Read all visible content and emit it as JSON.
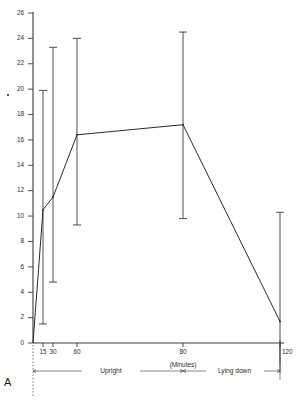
{
  "figure": {
    "panel_label": "A",
    "cut_off_header": "",
    "xlabel": "(Minutes)",
    "phases": [
      {
        "name": "Upright",
        "from_min": 0,
        "to_min": 80
      },
      {
        "name": "Lying down",
        "from_min": 80,
        "to_min": 120
      }
    ]
  },
  "chart_data": {
    "type": "line",
    "title": "",
    "subtitle": "",
    "xlabel": "(Minutes)",
    "ylabel": "",
    "x": [
      0,
      15,
      30,
      60,
      80,
      120
    ],
    "xtick_labels": [
      "15",
      "30",
      "60",
      "80",
      "120"
    ],
    "xticks": [
      15,
      30,
      60,
      80,
      120
    ],
    "xlim": [
      0,
      120
    ],
    "ylim": [
      0,
      26
    ],
    "yticks": [
      0,
      2,
      4,
      6,
      8,
      10,
      12,
      14,
      16,
      18,
      20,
      22,
      24,
      26
    ],
    "ytick_labels": [
      "0",
      "2",
      "4",
      "6",
      "8",
      "10",
      "12",
      "14",
      "16",
      "18",
      "20",
      "22",
      "24",
      "26"
    ],
    "grid": false,
    "legend": false,
    "axis_note": "x-axis spacing is compressed between 0 and 60 minutes",
    "series": [
      {
        "name": "",
        "values": [
          0.0,
          10.5,
          11.5,
          16.4,
          17.2,
          1.7
        ],
        "err_low": [
          0.0,
          1.5,
          4.8,
          9.3,
          9.8,
          -1.6
        ],
        "err_high": [
          0.0,
          19.9,
          23.3,
          24.0,
          24.5,
          10.3
        ],
        "error_type": "range",
        "marker": "none",
        "color": "#2b2b2b"
      }
    ],
    "annotations": [
      {
        "text": "Upright",
        "type": "phase-bracket"
      },
      {
        "text": "Lying down",
        "type": "phase-bracket"
      },
      {
        "text": "A",
        "type": "panel-label"
      }
    ]
  },
  "geometry": {
    "x_px": {
      "0": 33,
      "15": 43,
      "30": 53,
      "60": 77,
      "80": 183,
      "120": 280
    },
    "y0_px": 343,
    "y26_px": 13
  }
}
